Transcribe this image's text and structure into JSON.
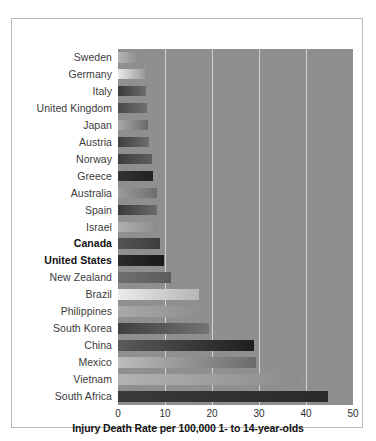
{
  "figure": {
    "top_cutoff_text": "· · ·"
  },
  "chart_data": {
    "type": "bar",
    "orientation": "horizontal",
    "title": "",
    "subtitle": "",
    "xlabel": "Injury Death Rate per 100,000 1- to 14-year-olds",
    "ylabel": "",
    "xlim": [
      0,
      50
    ],
    "ylim": null,
    "xticks": [
      0,
      10,
      20,
      30,
      40,
      50
    ],
    "xtick_labels": [
      "0",
      "10",
      "20",
      "30",
      "40",
      "50"
    ],
    "grid": "vertical",
    "legend": null,
    "plot_background": "#8f8f8f",
    "gridline_color": "#d2d2d2",
    "frame_color": "#b9b9b9",
    "categories": [
      "Sweden",
      "Germany",
      "Italy",
      "United Kingdom",
      "Japan",
      "Austria",
      "Norway",
      "Greece",
      "Australia",
      "Spain",
      "Israel",
      "Canada",
      "United States",
      "New Zealand",
      "Brazil",
      "Philippines",
      "South Korea",
      "China",
      "Mexico",
      "Vietnam",
      "South Africa"
    ],
    "values": [
      4.5,
      5.8,
      6.0,
      6.1,
      6.4,
      6.5,
      7.3,
      7.5,
      8.2,
      8.3,
      8.4,
      9.0,
      9.8,
      11.2,
      17.3,
      18.3,
      19.3,
      29.0,
      29.4,
      38.5,
      44.6
    ],
    "emphasized": [
      "Canada",
      "United States"
    ],
    "bar_fill_start": [
      "#b4b4b4",
      "#e8e8e8",
      "#3a3a3a",
      "#4a4a4a",
      "#a8a8a8",
      "#3f3f3f",
      "#3d3d3d",
      "#333333",
      "#9b9b9b",
      "#3a3a3a",
      "#b0b0b0",
      "#555555",
      "#2b2b2b",
      "#6f6f6f",
      "#ebebeb",
      "#a9a9a9",
      "#3f3f3f",
      "#5a5a5a",
      "#bdbdbd",
      "#b2b2b2",
      "#3a3a3a"
    ],
    "bar_fill_end": [
      "#8a8a8a",
      "#9a9a9a",
      "#6d6d6d",
      "#6f6f6f",
      "#6a6a6a",
      "#6d6d6d",
      "#5f5f5f",
      "#1f1f1f",
      "#6e6e6e",
      "#6b6b6b",
      "#8d8d8d",
      "#3d3d3d",
      "#1a1a1a",
      "#5c5c5c",
      "#b6b6b6",
      "#8d8d8d",
      "#737373",
      "#1e1e1e",
      "#6b6b6b",
      "#8c8c8c",
      "#2a2a2a"
    ]
  }
}
